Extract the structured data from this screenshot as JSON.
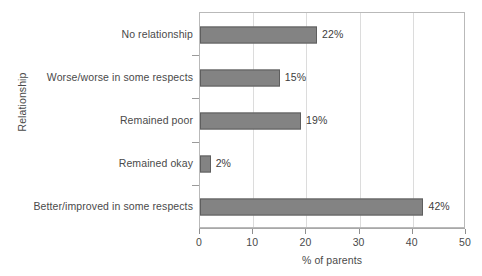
{
  "chart_data": {
    "type": "bar",
    "orientation": "horizontal",
    "title": "",
    "xlabel": "% of parents",
    "ylabel": "Relationship",
    "xlim": [
      0,
      50
    ],
    "xticks": [
      "0",
      "10",
      "20",
      "30",
      "40",
      "50"
    ],
    "grid": "vertical",
    "legend": "none",
    "categories": [
      "Better/improved in some respects",
      "Remained okay",
      "Remained poor",
      "Worse/worse in some respects",
      "No relationship"
    ],
    "values": [
      42,
      2,
      19,
      15,
      22
    ],
    "value_labels": [
      "42%",
      "2%",
      "19%",
      "15%",
      "22%"
    ],
    "colors": {
      "bar_fill": "#838383",
      "bar_border": "#5e5e5e",
      "gridline": "#dcdcdc",
      "axis": "#a8a8a8",
      "text": "#4a4a4a",
      "background": "#ffffff"
    }
  }
}
